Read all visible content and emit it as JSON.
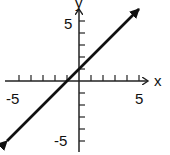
{
  "chart_data": {
    "type": "line",
    "title": "",
    "xlabel": "x",
    "ylabel": "y",
    "xlim": [
      -6,
      6
    ],
    "ylim": [
      -6,
      6
    ],
    "grid": false,
    "x_tick_labels": [
      "-5",
      "5"
    ],
    "y_tick_labels": [
      "5",
      "-5"
    ],
    "tick_step": 1,
    "series": [
      {
        "name": "y = x + 1",
        "equation": "y = x + 1",
        "slope": 1,
        "intercept": 1,
        "x": [
          -6,
          5
        ],
        "y": [
          -5,
          6
        ],
        "arrows_both_ends": true
      }
    ]
  },
  "axes": {
    "x_label": "x",
    "y_label": "y",
    "x_neg_label": "-5",
    "x_pos_label": "5",
    "y_pos_label": "5",
    "y_neg_label": "-5"
  },
  "colors": {
    "line": "#111111",
    "axis": "#222222",
    "background": "#ffffff"
  }
}
